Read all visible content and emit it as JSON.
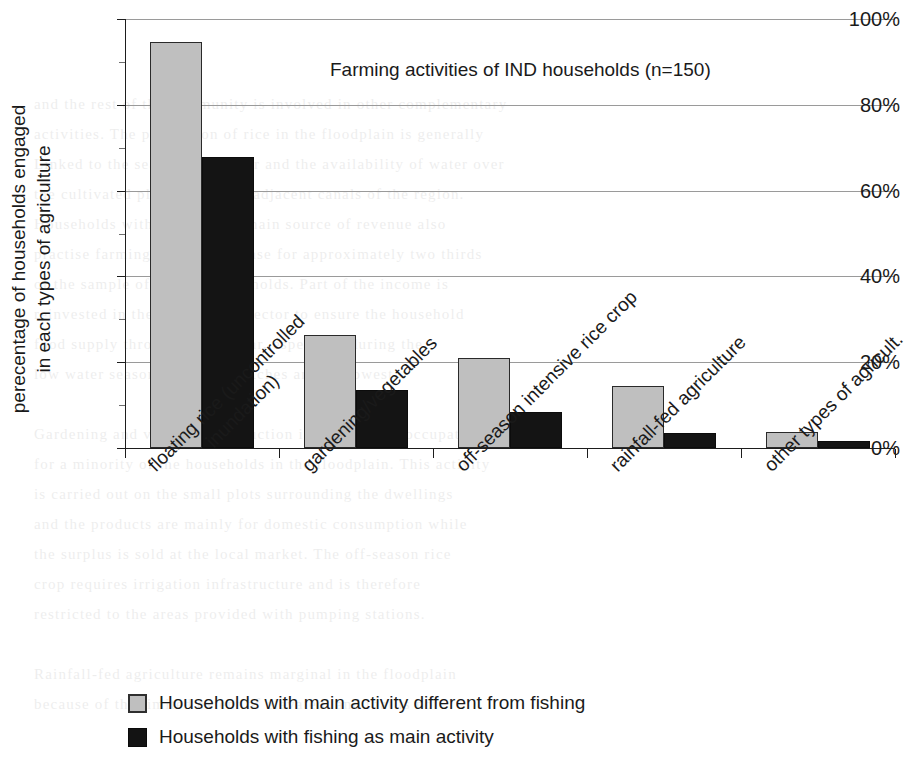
{
  "chart_data": {
    "type": "bar",
    "title": "Farming activities of IND households (n=150)",
    "xlabel": "",
    "ylabel": "perecentage of households engaged in each types of agriculture",
    "ylabel_lines": [
      "perecentage of households engaged",
      "in each types of agriculture"
    ],
    "ylim": [
      0,
      100
    ],
    "ytick_labels": [
      "0%",
      "20%",
      "40%",
      "60%",
      "80%",
      "100%"
    ],
    "ytick_values": [
      0,
      20,
      40,
      60,
      80,
      100
    ],
    "grid": true,
    "legend_position": "bottom-left",
    "categories": [
      "floating rice (uncontrolled inundation)",
      "gardening/vegetables",
      "off-season intensive rice crop",
      "rainfall-fed agriculture",
      "other types of agricult."
    ],
    "category_lines": [
      [
        "floating rice (uncontrolled",
        "inundation)"
      ],
      [
        "gardening/vegetables"
      ],
      [
        "off-season intensive rice crop"
      ],
      [
        "rainfall-fed agriculture"
      ],
      [
        "other types of agricult."
      ]
    ],
    "series": [
      {
        "name": "Households with main activity different from fishing",
        "color": "#bfbfbf",
        "values": [
          94.7,
          26.3,
          21.0,
          14.5,
          3.7
        ]
      },
      {
        "name": "Households with fishing as main activity",
        "color": "#131313",
        "values": [
          67.8,
          13.6,
          8.4,
          3.5,
          1.7
        ]
      }
    ]
  },
  "legend": {
    "items": [
      {
        "label": "Households with main activity different from fishing",
        "swatch": "light"
      },
      {
        "label": "Households with fishing as main activity",
        "swatch": "dark"
      }
    ]
  },
  "background_text": {
    "lines": [
      "and the rest of the community is involved in other complementary",
      "activities. The production of rice in the floodplain is generally",
      "Linked to the seasonal calendar and the availability of water over",
      "the cultivated plots and in the adjacent canals of the region.",
      "Households with fishing as a main source of revenue also",
      "practise farming. This is the case for approximately two thirds",
      "of the sample of fishing households. Part of the income is",
      "reinvested in the agricultural sector to ensure the household",
      "food supply throughout the year, especially during the",
      "low water season when fish catches are the lowest.",
      "",
      "Gardening and vegetable production is a secondary occupation",
      "for a minority of the households in the floodplain. This activity",
      "is carried out on the small plots surrounding the dwellings",
      "and the products are mainly for domestic consumption while",
      "the surplus is sold at the local market. The off-season rice",
      "crop requires irrigation infrastructure and is therefore",
      "restricted to the areas provided with pumping stations.",
      "",
      "Rainfall-fed agriculture remains marginal in the floodplain",
      "because of the limited extent of elevated land that is not"
    ]
  }
}
